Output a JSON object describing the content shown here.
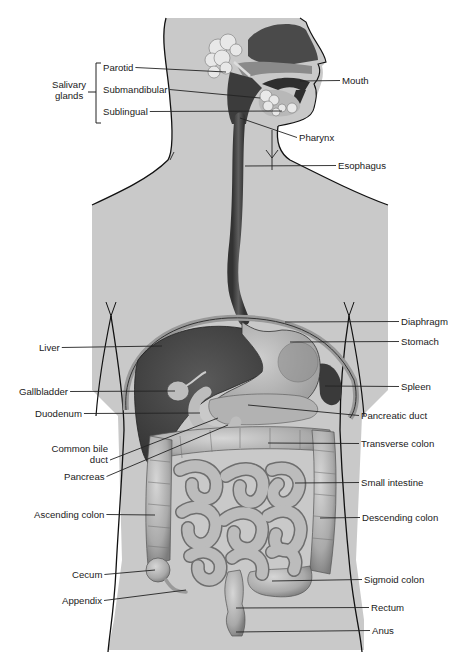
{
  "diagram": {
    "colors": {
      "background": "#ffffff",
      "body_fill": "#c9c9c9",
      "outline": "#111111",
      "organ_dark": "#444444",
      "organ_mid": "#6a6a6a",
      "organ_light": "#a8a8a8",
      "intestine": "#b4b4b4",
      "intestine_shade": "#8e8e8e",
      "gland": "#e6e6e6",
      "leader_line": "#222222"
    },
    "group_label": {
      "text_line1": "Salivary",
      "text_line2": "glands",
      "x": 52,
      "y": 79
    },
    "labels": [
      {
        "id": "parotid",
        "text": "Parotid",
        "side": "left",
        "x": 103,
        "y": 67,
        "line_to": [
          226,
          72
        ]
      },
      {
        "id": "submandibular",
        "text": "Submandibular",
        "side": "left",
        "x": 103,
        "y": 88,
        "line_to": [
          260,
          98
        ]
      },
      {
        "id": "sublingual",
        "text": "Sublingual",
        "side": "left",
        "x": 103,
        "y": 110,
        "line_to": [
          282,
          111
        ]
      },
      {
        "id": "mouth",
        "text": "Mouth",
        "side": "right",
        "x": 342,
        "y": 75,
        "line_to": [
          300,
          81
        ]
      },
      {
        "id": "pharynx",
        "text": "Pharynx",
        "side": "right",
        "x": 298,
        "y": 132,
        "line_to": [
          240,
          118
        ]
      },
      {
        "id": "esophagus",
        "text": "Esophagus",
        "side": "right",
        "x": 338,
        "y": 160,
        "line_to": [
          245,
          166
        ]
      },
      {
        "id": "diaphragm",
        "text": "Diaphragm",
        "side": "right",
        "x": 401,
        "y": 316,
        "line_to": [
          285,
          322
        ]
      },
      {
        "id": "stomach",
        "text": "Stomach",
        "side": "right",
        "x": 401,
        "y": 336,
        "line_to": [
          290,
          342
        ]
      },
      {
        "id": "liver",
        "text": "Liver",
        "side": "left",
        "x": 39,
        "y": 343,
        "line_to": [
          162,
          346
        ]
      },
      {
        "id": "spleen",
        "text": "Spleen",
        "side": "right",
        "x": 401,
        "y": 381,
        "line_to": [
          325,
          386
        ]
      },
      {
        "id": "gallbladder",
        "text": "Gallbladder",
        "side": "left",
        "x": 19,
        "y": 386,
        "line_to": [
          175,
          391
        ]
      },
      {
        "id": "duodenum",
        "text": "Duodenum",
        "side": "left",
        "x": 35,
        "y": 408,
        "line_to": [
          200,
          413
        ]
      },
      {
        "id": "pancreatic_duct",
        "text": "Pancreatic duct",
        "side": "right",
        "x": 361,
        "y": 409,
        "line_to": [
          248,
          405
        ]
      },
      {
        "id": "common_bile_duct",
        "text_line1": "Common bile",
        "text_line2": "duct",
        "side": "left",
        "x": 45,
        "y": 444,
        "line_to": [
          218,
          418
        ]
      },
      {
        "id": "transverse_colon",
        "text": "Transverse colon",
        "side": "right",
        "x": 361,
        "y": 437,
        "line_to": [
          268,
          443
        ]
      },
      {
        "id": "pancreas",
        "text": "Pancreas",
        "side": "left",
        "x": 64,
        "y": 471,
        "line_to": [
          228,
          425
        ]
      },
      {
        "id": "small_intestine",
        "text": "Small intestine",
        "side": "right",
        "x": 361,
        "y": 477,
        "line_to": [
          295,
          483
        ]
      },
      {
        "id": "ascending_colon",
        "text": "Ascending colon",
        "side": "left",
        "x": 34,
        "y": 509,
        "line_to": [
          155,
          515
        ]
      },
      {
        "id": "descending_colon",
        "text": "Descending colon",
        "side": "right",
        "x": 362,
        "y": 512,
        "line_to": [
          320,
          518
        ]
      },
      {
        "id": "cecum",
        "text": "Cecum",
        "side": "left",
        "x": 72,
        "y": 569,
        "line_to": [
          155,
          570
        ]
      },
      {
        "id": "sigmoid_colon",
        "text": "Sigmoid colon",
        "side": "right",
        "x": 364,
        "y": 574,
        "line_to": [
          272,
          581
        ]
      },
      {
        "id": "appendix",
        "text": "Appendix",
        "side": "left",
        "x": 62,
        "y": 595,
        "line_to": [
          186,
          590
        ]
      },
      {
        "id": "rectum",
        "text": "Rectum",
        "side": "right",
        "x": 371,
        "y": 602,
        "line_to": [
          236,
          608
        ]
      },
      {
        "id": "anus",
        "text": "Anus",
        "side": "right",
        "x": 372,
        "y": 625,
        "line_to": [
          236,
          632
        ]
      }
    ]
  }
}
